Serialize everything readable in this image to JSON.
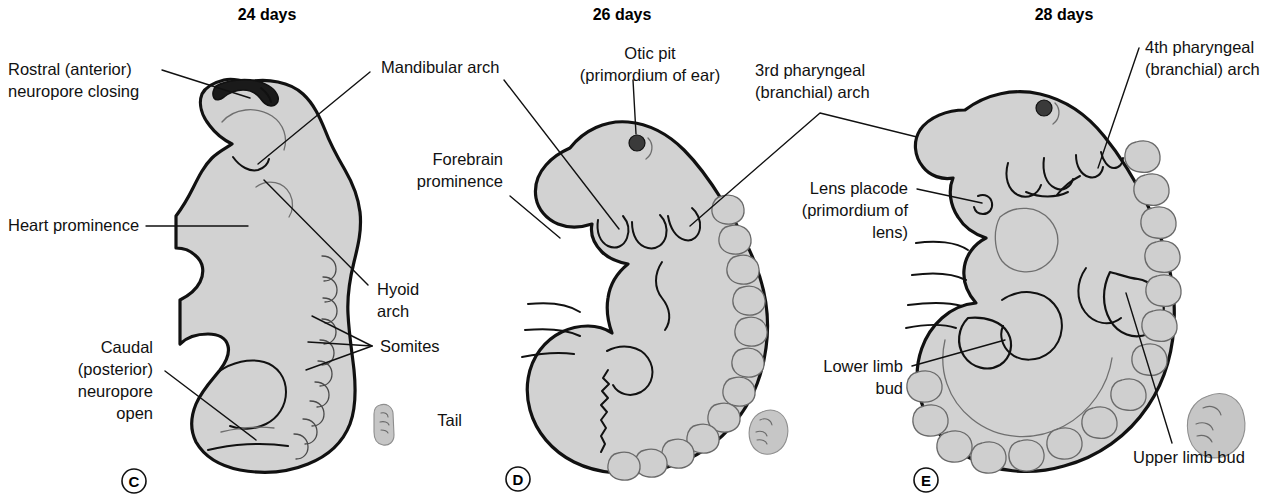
{
  "colors": {
    "embryo_fill": "#d2d2d2",
    "outline_stroke": "#111111",
    "background": "#ffffff",
    "otic_pit_fill": "#3a3a3a",
    "mini_embryo_fill": "#c6c6c6"
  },
  "panels": [
    {
      "id": "C",
      "letter": "C",
      "title": "24 days",
      "labels": [
        {
          "name": "rostral-neuropore",
          "lines": [
            "Rostral (anterior)",
            "neuropore closing"
          ]
        },
        {
          "name": "heart-prominence",
          "lines": [
            "Heart prominence"
          ]
        },
        {
          "name": "caudal-neuropore",
          "lines": [
            "Caudal",
            "(posterior)",
            "neuropore",
            "open"
          ]
        },
        {
          "name": "hyoid-arch",
          "lines": [
            "Hyoid",
            "arch"
          ]
        },
        {
          "name": "somites",
          "lines": [
            "Somites"
          ]
        },
        {
          "name": "mandibular-arch",
          "lines": [
            "Mandibular arch"
          ]
        }
      ]
    },
    {
      "id": "D",
      "letter": "D",
      "title": "26 days",
      "labels": [
        {
          "name": "otic-pit",
          "lines": [
            "Otic pit",
            "(primordium of ear)"
          ]
        },
        {
          "name": "forebrain-prominence",
          "lines": [
            "Forebrain",
            "prominence"
          ]
        },
        {
          "name": "tail",
          "lines": [
            "Tail"
          ]
        },
        {
          "name": "third-pharyngeal-arch",
          "lines": [
            "3rd pharyngeal",
            "(branchial) arch"
          ]
        }
      ]
    },
    {
      "id": "E",
      "letter": "E",
      "title": "28 days",
      "labels": [
        {
          "name": "fourth-pharyngeal-arch",
          "lines": [
            "4th pharyngeal",
            "(branchial) arch"
          ]
        },
        {
          "name": "lens-placode",
          "lines": [
            "Lens placode",
            "(primordium of",
            "lens)"
          ]
        },
        {
          "name": "lower-limb-bud",
          "lines": [
            "Lower limb",
            "bud"
          ]
        },
        {
          "name": "upper-limb-bud",
          "lines": [
            "Upper limb bud"
          ]
        }
      ]
    }
  ],
  "text": {
    "title_24": "24 days",
    "title_26": "26 days",
    "title_28": "28 days",
    "letter_c": "C",
    "letter_d": "D",
    "letter_e": "E",
    "rostral_1": "Rostral (anterior)",
    "rostral_2": "neuropore closing",
    "heart_1": "Heart prominence",
    "caudal_1": "Caudal",
    "caudal_2": "(posterior)",
    "caudal_3": "neuropore",
    "caudal_4": "open",
    "mandibular_1": "Mandibular arch",
    "hyoid_1": "Hyoid",
    "hyoid_2": "arch",
    "somites_1": "Somites",
    "oticpit_1": "Otic pit",
    "oticpit_2": "(primordium of ear)",
    "forebrain_1": "Forebrain",
    "forebrain_2": "prominence",
    "tail_1": "Tail",
    "third_arch_1": "3rd pharyngeal",
    "third_arch_2": "(branchial) arch",
    "fourth_arch_1": "4th pharyngeal",
    "fourth_arch_2": "(branchial) arch",
    "lens_1": "Lens placode",
    "lens_2": "(primordium of",
    "lens_3": "lens)",
    "lower_limb_1": "Lower limb",
    "lower_limb_2": "bud",
    "upper_limb_1": "Upper limb bud"
  }
}
